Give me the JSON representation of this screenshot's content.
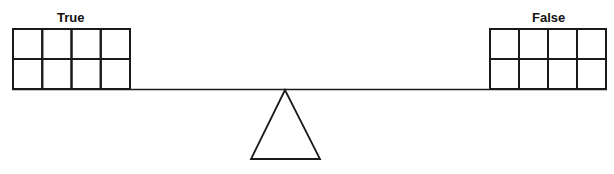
{
  "diagram": {
    "left_pan": {
      "label": "True",
      "rows": 2,
      "cols": 4
    },
    "right_pan": {
      "label": "False",
      "rows": 2,
      "cols": 4
    },
    "fulcrum": "triangle",
    "stroke_color": "#1a1a1a",
    "background": "#ffffff"
  }
}
